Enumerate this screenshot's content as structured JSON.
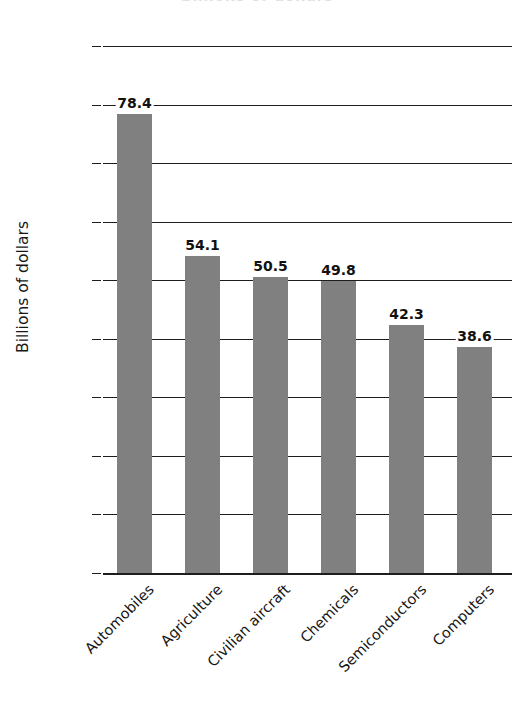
{
  "chart_data": {
    "type": "bar",
    "title": "",
    "xlabel": "",
    "ylabel": "Billions of dollars",
    "categories": [
      "Automobiles",
      "Agriculture",
      "Civilian aircraft",
      "Chemicals",
      "Semiconductors",
      "Computers"
    ],
    "values": [
      78.4,
      54.1,
      50.5,
      49.8,
      42.3,
      38.6
    ],
    "value_labels": [
      "78.4",
      "54.1",
      "50.5",
      "49.8",
      "42.3",
      "38.6"
    ],
    "ylim": [
      0,
      90
    ],
    "ytick_labels": [
      "90",
      "80",
      "70",
      "60",
      "50",
      "40",
      "30",
      "20",
      "10",
      "0"
    ],
    "ytick_values": [
      90,
      80,
      70,
      60,
      50,
      40,
      30,
      20,
      10,
      0
    ],
    "ytick_step": 10,
    "grid": true,
    "grid_axis": "y",
    "legend": "none",
    "bar_color": "#808080",
    "axis_color": "#1d1d1d",
    "text_color": "#141414",
    "background": "#ffffff",
    "category_label_rotation": -45
  },
  "figure": {
    "cropped_title": "Billions of dollars"
  }
}
